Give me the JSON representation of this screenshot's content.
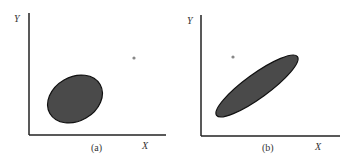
{
  "figure": {
    "panels": [
      {
        "id": "a",
        "caption": "(a)",
        "x_label": "X",
        "y_label": "Y",
        "ellipse": {
          "cx": 75,
          "cy": 99,
          "rx": 29,
          "ry": 22,
          "angle": -30,
          "fill": "#4a4a4a"
        },
        "point": {
          "cx": 134,
          "cy": 58
        }
      },
      {
        "id": "b",
        "caption": "(b)",
        "x_label": "X",
        "y_label": "Y",
        "ellipse": {
          "cx": 257,
          "cy": 86,
          "rx": 50,
          "ry": 12,
          "angle": -36,
          "fill": "#4a4a4a"
        },
        "point": {
          "cx": 233,
          "cy": 57
        }
      }
    ],
    "colors": {
      "axis": "#222222",
      "ellipse_fill": "#4a4a4a",
      "ellipse_stroke": "#111111",
      "point": "#888888"
    }
  }
}
